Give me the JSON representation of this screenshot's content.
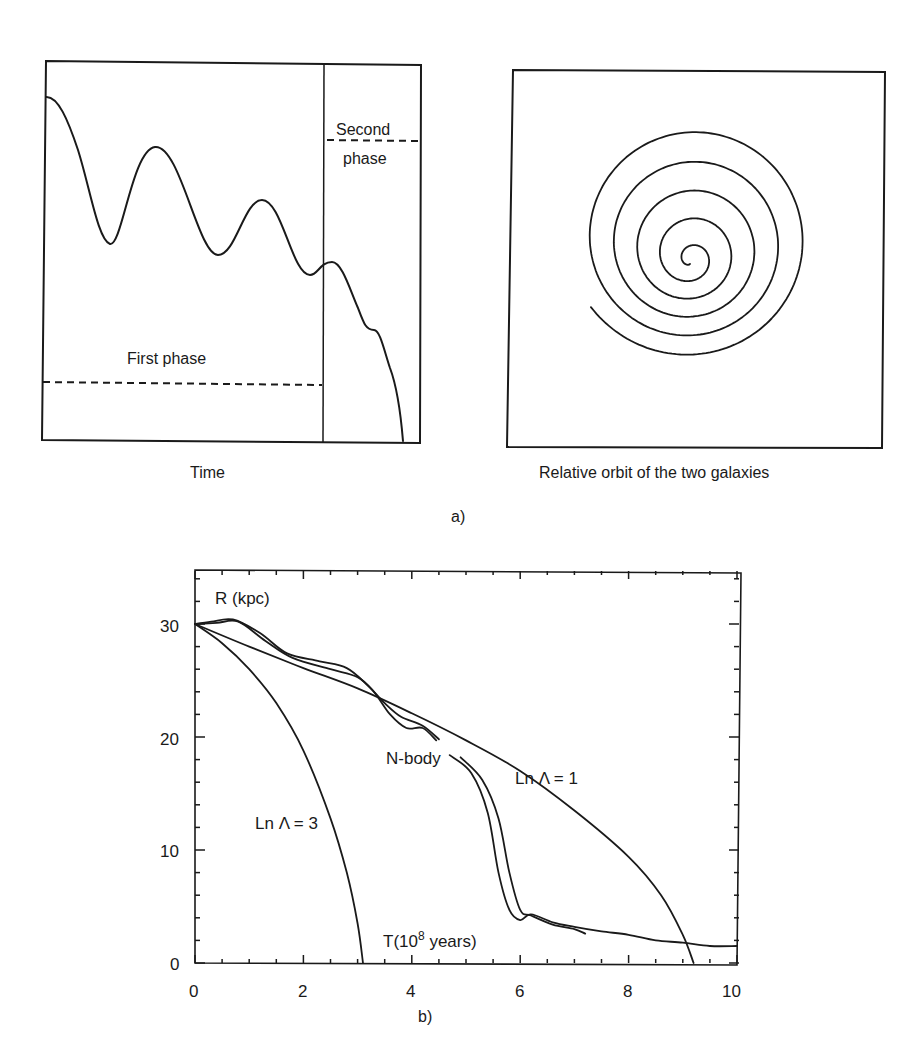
{
  "figure": {
    "panel_a": {
      "label": "a)",
      "left_plot": {
        "xlabel": "Time",
        "first_phase_label": "First phase",
        "second_phase_label_line1": "Second",
        "second_phase_label_line2": "phase"
      },
      "right_plot": {
        "caption": "Relative orbit of the two galaxies"
      }
    },
    "panel_b": {
      "label": "b)",
      "ylabel": "R (kpc)",
      "xlabel": "T(10",
      "xlabel_sup": "8",
      "xlabel_tail": " years)",
      "annotations": {
        "nbody": "N-body",
        "lnlambda1": "Ln Λ = 1",
        "lnlambda3": "Ln Λ = 3"
      },
      "xticks": [
        "0",
        "2",
        "4",
        "6",
        "8",
        "10"
      ],
      "yticks": [
        "0",
        "10",
        "20",
        "30"
      ]
    }
  },
  "chart_data": [
    {
      "type": "line",
      "title": "Schematic separation vs time (panel a, left)",
      "xlabel": "Time",
      "ylabel": "",
      "annotations": [
        "First phase",
        "Second phase"
      ],
      "series": [
        {
          "name": "separation (schematic)",
          "x": [
            0,
            0.08,
            0.17,
            0.3,
            0.42,
            0.55,
            0.66,
            0.73,
            0.8,
            0.86,
            0.92,
            0.96,
            1.0
          ],
          "y": [
            0.88,
            0.53,
            0.77,
            0.48,
            0.63,
            0.45,
            0.45,
            0.47,
            0.38,
            0.31,
            0.18,
            0.02,
            0.0
          ]
        }
      ],
      "phase_divider_x": 0.75,
      "grid": false
    },
    {
      "type": "line",
      "title": "Relative orbit of the two galaxies (panel a, right)",
      "description": "inspiralling spiral trajectory, ~5 turns, converging to centre",
      "grid": false
    },
    {
      "type": "line",
      "title": "",
      "xlabel": "T(10^8 years)",
      "ylabel": "R (kpc)",
      "xlim": [
        0,
        10
      ],
      "ylim": [
        0,
        34.7
      ],
      "xticks": [
        0,
        2,
        4,
        6,
        8,
        10
      ],
      "yticks": [
        0,
        10,
        20,
        30
      ],
      "grid": false,
      "series": [
        {
          "name": "Ln Λ = 3",
          "x": [
            0,
            0.5,
            1.0,
            1.5,
            2.0,
            2.5,
            2.8,
            3.0,
            3.1
          ],
          "y": [
            30,
            28.3,
            26.0,
            23.0,
            18.8,
            12.8,
            8.0,
            3.5,
            0
          ]
        },
        {
          "name": "Ln Λ = 1",
          "x": [
            0,
            1,
            2,
            3,
            4,
            5,
            6,
            7,
            8,
            8.6,
            9.0,
            9.2
          ],
          "y": [
            30,
            28.0,
            26.1,
            24.3,
            22.1,
            19.7,
            17.0,
            13.5,
            9.4,
            6.0,
            2.5,
            0
          ]
        },
        {
          "name": "N-body (run 1)",
          "x": [
            0,
            0.3,
            0.7,
            1.2,
            1.7,
            2.3,
            2.8,
            3.2,
            3.5,
            3.8,
            4.2,
            4.5,
            4.9,
            5.3,
            5.6,
            5.8,
            6.0,
            6.2,
            6.6,
            7.0,
            7.2
          ],
          "y": [
            30,
            30.2,
            30.4,
            29.2,
            27.4,
            26.7,
            26.1,
            24.5,
            23.0,
            21.8,
            21.0,
            19.8,
            18.2,
            16.2,
            12.8,
            8.0,
            4.7,
            4.2,
            3.4,
            3.0,
            2.6
          ]
        },
        {
          "name": "N-body (run 2)",
          "x": [
            0,
            0.4,
            0.8,
            1.3,
            1.8,
            2.5,
            3.0,
            3.3,
            3.6,
            3.9,
            4.2,
            4.45,
            4.7,
            5.1,
            5.4,
            5.6,
            5.8,
            6.0,
            6.2,
            6.6,
            7.0,
            7.5,
            8.0,
            8.5,
            9.0,
            9.5,
            10.0
          ],
          "y": [
            30,
            30.1,
            30.2,
            28.5,
            27.0,
            26.0,
            25.3,
            24.0,
            22.0,
            20.8,
            20.8,
            19.7,
            18.4,
            16.8,
            13.3,
            8.0,
            4.7,
            3.8,
            4.3,
            3.6,
            3.2,
            2.8,
            2.5,
            2.0,
            1.8,
            1.5,
            1.5
          ]
        }
      ],
      "annotations": [
        "R (kpc)",
        "N-body",
        "Ln Λ = 1",
        "Ln Λ = 3",
        "T(10^8 years)"
      ]
    }
  ]
}
